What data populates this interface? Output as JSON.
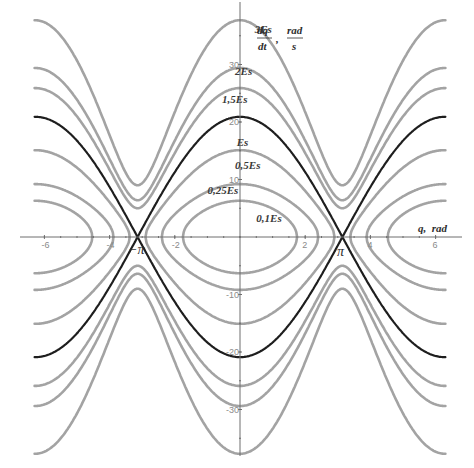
{
  "chart_data": {
    "type": "line",
    "title": "",
    "subtitle": "Phase portrait (level curves of energy)",
    "xlabel": "q, rad",
    "ylabel": "dq/dt, rad/s",
    "ylabel_parts": {
      "num": "dq",
      "den": "dt",
      "sep": ",",
      "unit_num": "rad",
      "unit_den": "s"
    },
    "xlim": [
      -6.3,
      6.3
    ],
    "ylim": [
      -40,
      40
    ],
    "grid": false,
    "legend": "none (curves labeled inline)",
    "x_ticks": [
      -6,
      -4,
      -2,
      2,
      4,
      6
    ],
    "x_tick_labels": [
      "-6",
      "-4",
      "-2",
      "2",
      "4",
      "6"
    ],
    "y_ticks": [
      30,
      20,
      10,
      -10,
      -20,
      -30
    ],
    "y_tick_labels": [
      "30",
      "20",
      "10",
      "-10",
      "-20",
      "-30"
    ],
    "special_x_labels": [
      {
        "x": -3.1416,
        "text": "−π"
      },
      {
        "x": 3.1416,
        "text": "π"
      }
    ],
    "series": [
      {
        "name": "3Es",
        "energy_ratio": 3.0,
        "kind": "rotation",
        "p_at_q0": 37.7,
        "p_at_qpi": 9.0,
        "color": "#a3a3a3"
      },
      {
        "name": "2Es",
        "energy_ratio": 2.0,
        "kind": "rotation",
        "p_at_q0": 29.4,
        "p_at_qpi": 6.4,
        "color": "#a3a3a3"
      },
      {
        "name": "1,5Es",
        "energy_ratio": 1.5,
        "kind": "rotation",
        "p_at_q0": 25.9,
        "p_at_qpi": 5.0,
        "color": "#a3a3a3"
      },
      {
        "name": "Es",
        "energy_ratio": 1.0,
        "kind": "separatrix",
        "p_at_q0": 20.9,
        "p_at_qpi": 0.0,
        "color": "#1e1e1e"
      },
      {
        "name": "0,5Es",
        "energy_ratio": 0.5,
        "kind": "libration",
        "p_at_q0": 15.1,
        "q_turning": 2.9,
        "color": "#a3a3a3"
      },
      {
        "name": "0,25Es",
        "energy_ratio": 0.25,
        "kind": "libration",
        "p_at_q0": 9.2,
        "q_turning": 2.4,
        "color": "#a3a3a3"
      },
      {
        "name": "0,1Es",
        "energy_ratio": 0.1,
        "kind": "libration",
        "p_at_q0": 6.3,
        "q_turning": 1.75,
        "color": "#a3a3a3"
      }
    ],
    "annotations": [
      {
        "text": "3Es",
        "x": 0.45,
        "y": 35.5
      },
      {
        "text": "2Es",
        "x": -0.15,
        "y": 28.2
      },
      {
        "text": "1,5Es",
        "x": -0.55,
        "y": 23.3
      },
      {
        "text": "Es",
        "x": -0.1,
        "y": 15.8
      },
      {
        "text": "0,5Es",
        "x": -0.15,
        "y": 11.9
      },
      {
        "text": "0,25Es",
        "x": -1.0,
        "y": 7.4
      },
      {
        "text": "0,1Es",
        "x": 0.5,
        "y": 2.6
      }
    ]
  },
  "labels": {
    "x_axis_title": "q,  rad",
    "y_axis_num": "dq",
    "y_axis_den": "dt",
    "y_axis_sep": ",",
    "y_axis_unit_num": "rad",
    "y_axis_unit_den": "s",
    "minus_pi": "−π",
    "pi": "π"
  }
}
